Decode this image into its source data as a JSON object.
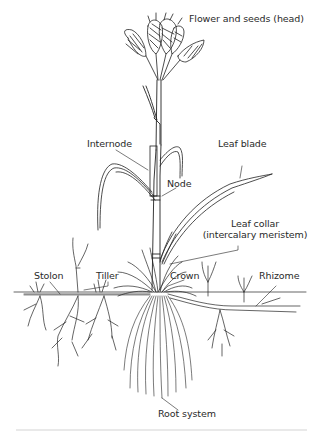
{
  "diagram": {
    "labels": {
      "head": "Flower and seeds (head)",
      "internode": "Internode",
      "leaf_blade": "Leaf blade",
      "node": "Node",
      "leaf_collar_line1": "Leaf collar",
      "leaf_collar_line2": "(intercalary meristem)",
      "stolon": "Stolon",
      "tiller": "Tiller",
      "crown": "Crown",
      "rhizome": "Rhizome",
      "root_system": "Root system"
    },
    "colors": {
      "line": "#222222",
      "text": "#2a2a2a",
      "background": "#ffffff",
      "rule": "#e9e9e9"
    }
  }
}
